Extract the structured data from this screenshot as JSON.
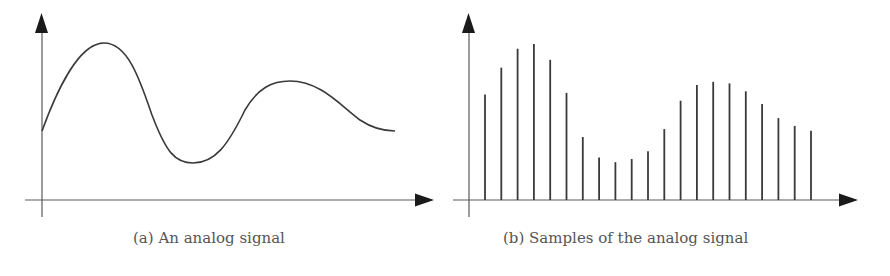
{
  "colors": {
    "ink": "#3a3a3a",
    "axis": "#5a5a5a",
    "arrow": "#1a1a1a",
    "caption": "#555555",
    "background": "#ffffff"
  },
  "panels": [
    {
      "id": "a",
      "caption": "(a) An analog signal"
    },
    {
      "id": "b",
      "caption": "(b) Samples of the analog signal"
    }
  ],
  "chart_data": [
    {
      "type": "line",
      "title": "(a) An analog signal",
      "xlabel": "",
      "ylabel": "",
      "grid": false,
      "ticks": "none",
      "description": "Continuous smooth waveform: starts mid-level, rises to a high peak, falls to a deep trough, rises to a smaller second peak, then settles to a mid-level value.",
      "x": [
        0,
        0.1,
        0.2,
        0.3,
        0.4,
        0.5,
        0.6,
        0.7,
        0.8,
        0.9,
        1.0
      ],
      "values": [
        0.44,
        0.86,
        0.83,
        0.28,
        0.24,
        0.55,
        0.67,
        0.62,
        0.5,
        0.44,
        0.44
      ]
    },
    {
      "type": "bar",
      "subtype": "stem",
      "title": "(b) Samples of the analog signal",
      "xlabel": "",
      "ylabel": "",
      "grid": false,
      "ticks": "none",
      "description": "21 uniformly spaced discrete samples (vertical stems) of the analog signal.",
      "categories": [
        1,
        2,
        3,
        4,
        5,
        6,
        7,
        8,
        9,
        10,
        11,
        12,
        13,
        14,
        15,
        16,
        17,
        18,
        19,
        20,
        21
      ],
      "values": [
        0.67,
        0.84,
        0.96,
        0.99,
        0.89,
        0.68,
        0.4,
        0.27,
        0.24,
        0.26,
        0.31,
        0.45,
        0.63,
        0.73,
        0.75,
        0.74,
        0.69,
        0.61,
        0.52,
        0.47,
        0.44
      ]
    }
  ]
}
